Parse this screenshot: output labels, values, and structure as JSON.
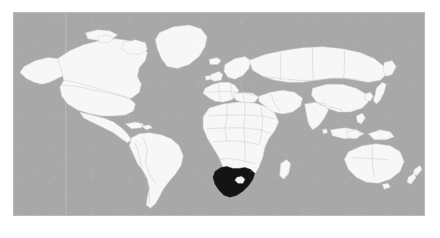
{
  "map": {
    "title": "World locator map",
    "projection": "equirectangular",
    "highlighted_country": "South Africa",
    "enclave_country": "Lesotho",
    "colors": {
      "ocean": "#a8a8a8",
      "land": "#f7f7f7",
      "land_border": "#bdbdbd",
      "coastline": "#cfcfcf",
      "highlight": "#141414",
      "frame": "#b9b9b9",
      "page_background": "#ffffff",
      "meridian": "#c2c2c2"
    },
    "frame": {
      "left": 13,
      "top": 12,
      "width": 412,
      "height": 204
    },
    "graticule": {
      "visible": true,
      "meridian_x": 52,
      "description": "single faint vertical meridian line over the Americas"
    },
    "regions": [
      {
        "name": "North America",
        "label": "north-america"
      },
      {
        "name": "Greenland",
        "label": "greenland"
      },
      {
        "name": "South America",
        "label": "south-america"
      },
      {
        "name": "Europe",
        "label": "europe"
      },
      {
        "name": "Africa",
        "label": "africa"
      },
      {
        "name": "Asia",
        "label": "asia"
      },
      {
        "name": "Australia",
        "label": "australia"
      },
      {
        "name": "New Zealand",
        "label": "new-zealand"
      },
      {
        "name": "Indonesia",
        "label": "indonesia"
      },
      {
        "name": "Japan",
        "label": "japan"
      },
      {
        "name": "Madagascar",
        "label": "madagascar"
      },
      {
        "name": "British Isles",
        "label": "british-isles"
      },
      {
        "name": "Iceland",
        "label": "iceland"
      },
      {
        "name": "Sri Lanka",
        "label": "sri-lanka"
      }
    ]
  }
}
